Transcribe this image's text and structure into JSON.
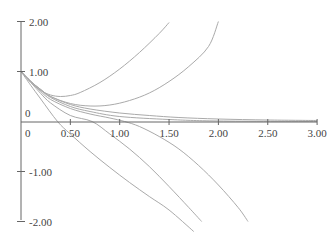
{
  "chart_data": {
    "type": "line",
    "title": "",
    "xlabel": "",
    "ylabel": "",
    "xlim": [
      0,
      3.0
    ],
    "ylim": [
      -2.0,
      2.0
    ],
    "grid": false,
    "legend": "none",
    "x_ticks": [
      0.5,
      1.0,
      1.5,
      2.0,
      2.5,
      3.0
    ],
    "x_tick_labels": [
      "0.50",
      "1.00",
      "1.50",
      "2.00",
      "2.50",
      "3.00"
    ],
    "x_origin_label": "0",
    "y_ticks": [
      2.0,
      1.0,
      -1.0,
      -2.0
    ],
    "y_tick_labels": [
      "2.00",
      "1.00",
      "-1.00",
      "-2.00"
    ],
    "y_origin_label": "0",
    "curve_color": "#aaaaaa",
    "axis_color": "#666666",
    "series": [
      {
        "name": "curve-1",
        "points": [
          [
            0,
            1
          ],
          [
            0.1,
            0.78
          ],
          [
            0.2,
            0.62
          ],
          [
            0.3,
            0.53
          ],
          [
            0.4,
            0.5
          ],
          [
            0.5,
            0.52
          ],
          [
            0.6,
            0.58
          ],
          [
            0.8,
            0.78
          ],
          [
            1.0,
            1.05
          ],
          [
            1.2,
            1.38
          ],
          [
            1.4,
            1.76
          ],
          [
            1.5,
            1.98
          ]
        ]
      },
      {
        "name": "curve-2",
        "points": [
          [
            0,
            1
          ],
          [
            0.1,
            0.8
          ],
          [
            0.2,
            0.64
          ],
          [
            0.3,
            0.5
          ],
          [
            0.5,
            0.36
          ],
          [
            0.7,
            0.31
          ],
          [
            0.9,
            0.33
          ],
          [
            1.1,
            0.42
          ],
          [
            1.3,
            0.57
          ],
          [
            1.5,
            0.8
          ],
          [
            1.7,
            1.1
          ],
          [
            1.9,
            1.5
          ],
          [
            2.0,
            2.0
          ]
        ]
      },
      {
        "name": "curve-3",
        "points": [
          [
            0,
            1
          ],
          [
            0.1,
            0.8
          ],
          [
            0.2,
            0.64
          ],
          [
            0.3,
            0.5
          ],
          [
            0.5,
            0.34
          ],
          [
            0.7,
            0.25
          ],
          [
            1.0,
            0.17
          ],
          [
            1.3,
            0.12
          ],
          [
            1.6,
            0.08
          ],
          [
            2.0,
            0.05
          ],
          [
            2.5,
            0.03
          ],
          [
            3.0,
            0.02
          ]
        ]
      },
      {
        "name": "curve-4",
        "points": [
          [
            0,
            1
          ],
          [
            0.1,
            0.8
          ],
          [
            0.2,
            0.63
          ],
          [
            0.3,
            0.48
          ],
          [
            0.5,
            0.3
          ],
          [
            0.7,
            0.2
          ],
          [
            1.0,
            0.1
          ],
          [
            1.5,
            0.04
          ],
          [
            2.0,
            0.01
          ],
          [
            3.0,
            0.0
          ]
        ]
      },
      {
        "name": "curve-5",
        "points": [
          [
            0,
            1
          ],
          [
            0.1,
            0.8
          ],
          [
            0.2,
            0.6
          ],
          [
            0.3,
            0.44
          ],
          [
            0.5,
            0.26
          ],
          [
            0.7,
            0.15
          ],
          [
            0.9,
            0.07
          ],
          [
            1.05,
            0.0
          ],
          [
            1.2,
            -0.1
          ],
          [
            1.4,
            -0.3
          ],
          [
            1.6,
            -0.55
          ],
          [
            1.8,
            -0.88
          ],
          [
            2.0,
            -1.27
          ],
          [
            2.2,
            -1.72
          ],
          [
            2.3,
            -2.0
          ]
        ]
      },
      {
        "name": "curve-6",
        "points": [
          [
            0,
            1
          ],
          [
            0.1,
            0.78
          ],
          [
            0.2,
            0.56
          ],
          [
            0.3,
            0.37
          ],
          [
            0.5,
            0.12
          ],
          [
            0.72,
            0.0
          ],
          [
            0.9,
            -0.25
          ],
          [
            1.1,
            -0.55
          ],
          [
            1.3,
            -0.9
          ],
          [
            1.5,
            -1.3
          ],
          [
            1.7,
            -1.72
          ],
          [
            1.83,
            -2.0
          ]
        ]
      },
      {
        "name": "curve-7",
        "points": [
          [
            0,
            1
          ],
          [
            0.1,
            0.72
          ],
          [
            0.2,
            0.45
          ],
          [
            0.37,
            0.0
          ],
          [
            0.5,
            -0.25
          ],
          [
            0.7,
            -0.6
          ],
          [
            0.9,
            -0.92
          ],
          [
            1.1,
            -1.22
          ],
          [
            1.3,
            -1.5
          ],
          [
            1.5,
            -1.77
          ],
          [
            1.75,
            -2.2
          ]
        ]
      }
    ]
  }
}
